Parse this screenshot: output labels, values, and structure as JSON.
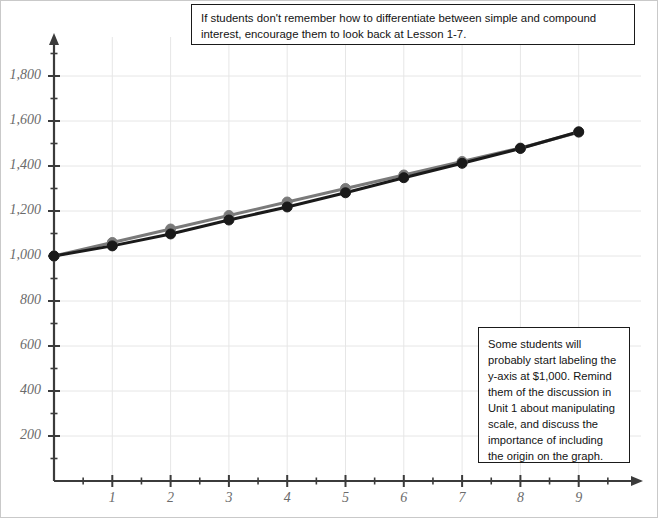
{
  "notes": {
    "top": "If students don't remember how to differentiate between simple and compound interest, encourage them to look back at Lesson 1-7.",
    "side": "Some students will probably start labeling the y-axis at $1,000. Remind them of the discussion in Unit 1 about manipulating scale, and discuss the importance of including the origin on the graph."
  },
  "chart_data": {
    "type": "line",
    "title": "",
    "xlabel": "",
    "ylabel": "",
    "xlim": [
      0,
      9.6
    ],
    "ylim": [
      0,
      1950
    ],
    "grid": true,
    "legend": "none",
    "x": [
      0,
      1,
      2,
      3,
      4,
      5,
      6,
      7,
      8,
      9
    ],
    "x_ticks": [
      "1",
      "2",
      "3",
      "4",
      "5",
      "6",
      "7",
      "8",
      "9"
    ],
    "y_ticks": [
      "200",
      "400",
      "600",
      "800",
      "1,000",
      "1,200",
      "1,400",
      "1,600",
      "1,800"
    ],
    "y_tick_values": [
      200,
      400,
      600,
      800,
      1000,
      1200,
      1400,
      1600,
      1800
    ],
    "y_minor_step": 100,
    "series": [
      {
        "name": "simple-interest",
        "color": "#7a7a7a",
        "values": [
          1000,
          1060,
          1120,
          1180,
          1240,
          1300,
          1360,
          1420,
          1480,
          1550
        ]
      },
      {
        "name": "compound-interest",
        "color": "#1a1a1a",
        "values": [
          1000,
          1045,
          1098,
          1160,
          1218,
          1281,
          1348,
          1412,
          1478,
          1552
        ]
      }
    ]
  },
  "colors": {
    "grid": "#e6e6e6",
    "axis": "#3b3b3b",
    "tick_text": "#6b6b6b",
    "note_border": "#1a1a1a"
  }
}
